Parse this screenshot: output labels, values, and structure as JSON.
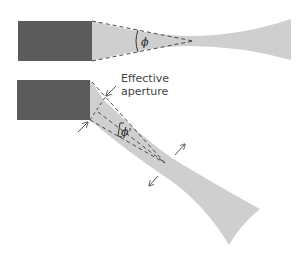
{
  "diagram": {
    "colors": {
      "emitter": "#5b5b5b",
      "beam": "#cfcfcf",
      "dash": "#4a4a4a",
      "arrow": "#555555",
      "text": "#444444"
    },
    "top_panel": {
      "angle_label": "ϕ"
    },
    "bottom_panel": {
      "annotation_line1": "Effective",
      "annotation_line2": "aperture",
      "angle_label": "ϕ'"
    }
  }
}
